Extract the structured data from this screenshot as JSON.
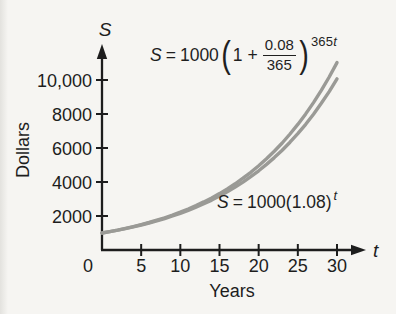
{
  "figure": {
    "background": "#f6f5f2",
    "ink_color": "#1d1d1d"
  },
  "chart_data": {
    "type": "line",
    "title": "",
    "xlabel": "Years",
    "ylabel": "Dollars",
    "x_axis_symbol": "t",
    "y_axis_symbol": "S",
    "xlim": [
      0,
      30
    ],
    "ylim": [
      0,
      11500
    ],
    "grid": false,
    "legend_position": "none",
    "curve_color": "#9a9a96",
    "x_ticks": [
      0,
      5,
      10,
      15,
      20,
      25,
      30
    ],
    "x_tick_labels": [
      "0",
      "5",
      "10",
      "15",
      "20",
      "25",
      "30"
    ],
    "y_ticks": [
      2000,
      4000,
      6000,
      8000,
      10000
    ],
    "y_tick_labels": [
      "2000",
      "4000",
      "6000",
      "8000",
      "10,000"
    ],
    "x": [
      0,
      1,
      2,
      3,
      4,
      5,
      6,
      7,
      8,
      9,
      10,
      11,
      12,
      13,
      14,
      15,
      16,
      17,
      18,
      19,
      20,
      21,
      22,
      23,
      24,
      25,
      26,
      27,
      28,
      29,
      30
    ],
    "series": [
      {
        "name": "daily-compounding",
        "label": "S = 1000(1 + 0.08/365)^(365t)",
        "values": [
          1000,
          1083.3,
          1173.5,
          1271.2,
          1377.1,
          1491.8,
          1616.1,
          1750.7,
          1896.5,
          2054.4,
          2225.5,
          2410.9,
          2611.7,
          2829.2,
          3064.9,
          3320.1,
          3596.6,
          3896.2,
          4220.7,
          4572.3,
          4953.0,
          5365.6,
          5812.5,
          6296.6,
          6821.0,
          7389.1,
          8004.5,
          8671.2,
          9393.3,
          10175.7,
          11023.2
        ]
      },
      {
        "name": "annual-compounding",
        "label": "S = 1000(1.08)^t",
        "values": [
          1000,
          1080,
          1166.4,
          1259.7,
          1360.5,
          1469.3,
          1586.9,
          1713.8,
          1850.9,
          1999.0,
          2158.9,
          2331.6,
          2518.2,
          2719.6,
          2937.2,
          3172.2,
          3425.9,
          3700.0,
          3996.0,
          4315.7,
          4661.0,
          5033.8,
          5436.5,
          5871.5,
          6341.2,
          6848.5,
          7396.4,
          7988.1,
          8627.1,
          9317.3,
          10062.7
        ]
      }
    ]
  },
  "equations": {
    "daily": {
      "lhs": "S",
      "rel": "=",
      "coeff": "1000",
      "open": "(",
      "inner": "1 +",
      "frac_num": "0.08",
      "frac_den": "365",
      "close": ")",
      "exp_num": "365",
      "exp_var": "t"
    },
    "annual": {
      "lhs": "S",
      "rel": "=",
      "body": "1000(1.08)",
      "exp_var": "t"
    }
  }
}
